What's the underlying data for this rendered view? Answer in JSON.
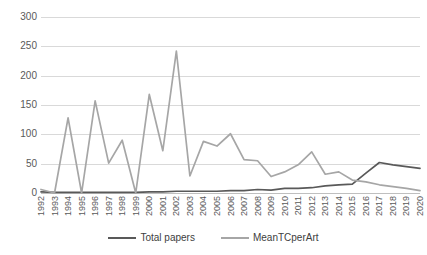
{
  "chart_data": {
    "type": "line",
    "title": "",
    "xlabel": "",
    "ylabel": "",
    "ylim": [
      0,
      300
    ],
    "yticks": [
      0,
      50,
      100,
      150,
      200,
      250,
      300
    ],
    "grid": true,
    "legend_position": "bottom",
    "categories": [
      "1992",
      "1993",
      "1994",
      "1995",
      "1996",
      "1997",
      "1998",
      "1999",
      "2000",
      "2001",
      "2002",
      "2003",
      "2004",
      "2005",
      "2006",
      "2007",
      "2008",
      "2009",
      "2010",
      "2011",
      "2012",
      "2013",
      "2014",
      "2015",
      "2016",
      "2017",
      "2018",
      "2019",
      "2020"
    ],
    "series": [
      {
        "name": "Total papers",
        "color": "#595959",
        "values": [
          2,
          1,
          1,
          1,
          1,
          1,
          1,
          1,
          2,
          2,
          3,
          3,
          3,
          3,
          4,
          4,
          6,
          5,
          8,
          8,
          9,
          12,
          14,
          15,
          34,
          52,
          48,
          45,
          42
        ]
      },
      {
        "name": "MeanTCperArt",
        "color": "#a6a6a6",
        "values": [
          6,
          0,
          128,
          0,
          157,
          51,
          90,
          0,
          168,
          72,
          242,
          29,
          88,
          80,
          101,
          57,
          55,
          28,
          36,
          48,
          70,
          32,
          36,
          22,
          19,
          14,
          11,
          8,
          4
        ]
      }
    ]
  },
  "legend": {
    "items": [
      {
        "label": "Total papers",
        "color": "#595959"
      },
      {
        "label": "MeanTCperArt",
        "color": "#a6a6a6"
      }
    ]
  }
}
